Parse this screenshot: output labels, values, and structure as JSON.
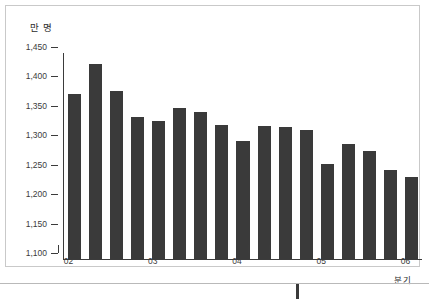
{
  "chart_data": {
    "type": "bar",
    "title": "",
    "subtitle": "",
    "unit_label": "만 명",
    "xlabel": "분기",
    "ylabel": "",
    "ylim": [
      1100,
      1450
    ],
    "ytick_values": [
      1100,
      1150,
      1200,
      1250,
      1300,
      1350,
      1400,
      1450
    ],
    "ytick_labels": [
      "1,100",
      "1,150",
      "1,200",
      "1,250",
      "1,300",
      "1,350",
      "1,400",
      "1,450"
    ],
    "grid": false,
    "legend": "none",
    "bar_color": "#3a3a3a",
    "axis_color": "#3b3b3b",
    "frame_color": "#c9c9c9",
    "categories": [
      "02Q1",
      "02Q2",
      "02Q3",
      "02Q4",
      "03Q1",
      "03Q2",
      "03Q3",
      "03Q4",
      "04Q1",
      "04Q2",
      "04Q3",
      "04Q4",
      "05Q1",
      "05Q2",
      "05Q3",
      "05Q4",
      "06Q1"
    ],
    "values": [
      1380,
      1432,
      1385,
      1341,
      1335,
      1357,
      1350,
      1328,
      1301,
      1326,
      1325,
      1320,
      1261,
      1295,
      1284,
      1251,
      1240
    ],
    "xtick_labels": [
      "02",
      "03",
      "04",
      "05",
      "06"
    ],
    "xtick_category_index": [
      0,
      4,
      8,
      12,
      16
    ]
  },
  "footer": {
    "note": ""
  }
}
